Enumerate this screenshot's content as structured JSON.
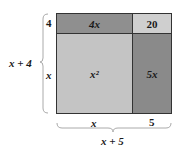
{
  "diagram": {
    "type": "area-model",
    "expression": "(x + 4)(x + 5)",
    "cells": {
      "top_left": {
        "label": "4x",
        "color": "#8f8f8f"
      },
      "top_right": {
        "label": "20",
        "color": "#cfcfcf"
      },
      "bottom_left": {
        "label": "x²",
        "color": "#c4c4c4"
      },
      "bottom_right": {
        "label": "5x",
        "color": "#8a8a8a"
      }
    },
    "side_labels": {
      "left_top": "4",
      "left_bottom": "x",
      "bottom_left": "x",
      "bottom_right": "5"
    },
    "brace_labels": {
      "left": "x + 4",
      "bottom": "x + 5"
    },
    "line_color": "#333333",
    "brace_color": "#aaaaaa"
  }
}
